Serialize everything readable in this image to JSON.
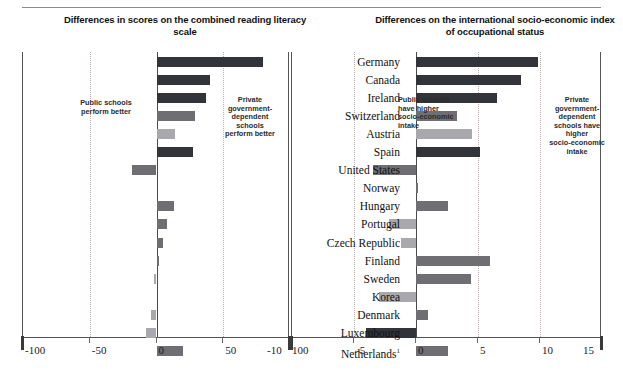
{
  "titles": {
    "left": "Differences in scores on\nthe combined reading literacy scale",
    "right": "Differences on the international\nsocio-economic index of occupational status"
  },
  "notes": {
    "left_public": "Public schools\nperform better",
    "left_private": "Private\ngovernment-\ndependent\nschools\nperform better",
    "right_public": "Public schools\nhave higher\nsocio-economic\nintake",
    "right_private": "Private\ngovernment-\ndependent\nschools have\nhigher\nsocio-economic\nintake"
  },
  "countries": [
    "Germany",
    "Canada",
    "Ireland",
    "Switzerland",
    "Austria",
    "Spain",
    "United States",
    "Norway",
    "Hungary",
    "Portugal",
    "Czech Republic",
    "Finland",
    "Sweden",
    "Korea",
    "Denmark",
    "Luxembourg",
    "Netherlands"
  ],
  "netherlands_footnote": "1",
  "colors": {
    "dark": "#33333a",
    "medium": "#6e6e73",
    "light": "#a8a8ad",
    "pale": "#c9c9ce",
    "band": "#c9c9c9",
    "band_light": "#dedede",
    "axis": "#3a3a3a",
    "grid": "#b9a9a9"
  },
  "chart_data": [
    {
      "type": "bar",
      "orientation": "horizontal",
      "title": "Differences in scores on the combined reading literacy scale",
      "xlabel": "",
      "ylabel": "",
      "xlim": [
        -100,
        100
      ],
      "xticks": [
        -100,
        -50,
        0,
        50,
        100
      ],
      "tick_labels": [
        "-100",
        "-50",
        "0",
        "50",
        "100"
      ],
      "grid": true,
      "legend": "none",
      "categories": [
        "Germany",
        "Canada",
        "Ireland",
        "Switzerland",
        "Austria",
        "Spain",
        "United States",
        "Norway",
        "Hungary",
        "Portugal",
        "Czech Republic",
        "Finland",
        "Sweden",
        "Korea",
        "Denmark",
        "Luxembourg",
        "Netherlands"
      ],
      "values": [
        80,
        40,
        37,
        29,
        14,
        27,
        -18,
        0,
        13,
        8,
        5,
        2,
        -2,
        0,
        -4,
        -8,
        20
      ],
      "shades": [
        "dark",
        "dark",
        "dark",
        "medium",
        "light",
        "dark",
        "medium",
        "none",
        "medium",
        "medium",
        "medium",
        "medium",
        "light",
        "none",
        "light",
        "light",
        "medium"
      ]
    },
    {
      "type": "bar",
      "orientation": "horizontal",
      "title": "Differences on the international socio-economic index of occupational status",
      "xlabel": "",
      "ylabel": "",
      "xlim": [
        -10,
        15
      ],
      "xticks": [
        -10,
        -5,
        0,
        5,
        10,
        15
      ],
      "tick_labels": [
        "-10",
        "-5",
        "0",
        "5",
        "10",
        "15"
      ],
      "grid": true,
      "legend": "none",
      "categories": [
        "Germany",
        "Canada",
        "Ireland",
        "Switzerland",
        "Austria",
        "Spain",
        "United States",
        "Norway",
        "Hungary",
        "Portugal",
        "Czech Republic",
        "Finland",
        "Sweden",
        "Korea",
        "Denmark",
        "Luxembourg",
        "Netherlands"
      ],
      "values": [
        9.8,
        8.5,
        6.5,
        3.3,
        4.5,
        5.2,
        -3.5,
        0.2,
        2.6,
        -2.2,
        -1.2,
        6.0,
        4.4,
        -3.0,
        1.0,
        -4.0,
        2.6
      ],
      "shades": [
        "dark",
        "dark",
        "dark",
        "medium",
        "light",
        "dark",
        "medium",
        "medium",
        "medium",
        "light",
        "light",
        "medium",
        "medium",
        "light",
        "medium",
        "dark",
        "medium"
      ]
    }
  ]
}
